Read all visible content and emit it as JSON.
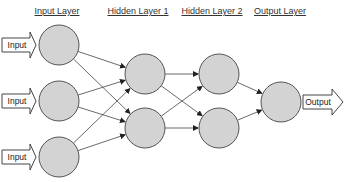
{
  "diagram": {
    "type": "neural-network",
    "layers": [
      {
        "title": "Input Layer",
        "x": 59,
        "nodes": [
          45,
          101,
          157
        ]
      },
      {
        "title": "Hidden Layer 1",
        "x": 145,
        "nodes": [
          74,
          128
        ]
      },
      {
        "title": "Hidden Layer 2",
        "x": 219,
        "nodes": [
          74,
          128
        ]
      },
      {
        "title": "Output Layer",
        "x": 281,
        "nodes": [
          102
        ]
      }
    ],
    "input_arrow_label": "Input",
    "output_arrow_label": "Output",
    "colors": {
      "node_fill": "#d3d3d3",
      "node_stroke": "#555555",
      "edge": "#444444"
    }
  }
}
